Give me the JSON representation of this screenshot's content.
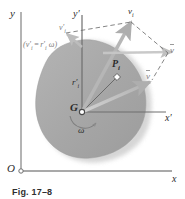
{
  "figure": {
    "caption": "Fig. 17–8",
    "type": "mechanics-diagram"
  },
  "axes": {
    "fixed": {
      "origin_label": "O",
      "x_label": "x",
      "y_label": "y"
    },
    "translating": {
      "x_label": "x′",
      "y_label": "y′"
    }
  },
  "points": {
    "mass_center": "G",
    "particle": "P",
    "particle_subscript": "i"
  },
  "vectors": {
    "absolute_velocity": "v",
    "absolute_velocity_sub": "i",
    "mean_velocity": "v",
    "relative_velocity": "v",
    "relative_velocity_sub": "i",
    "position_vector": "r",
    "position_vector_sub": "i",
    "angular_velocity": "ω"
  },
  "annotations": {
    "relative_speed_relation": "(v′ = r′  ω)",
    "relative_speed_relation_parts": {
      "open": "(",
      "v": "v",
      "v_sub": "i",
      "eq": "=",
      "r": "r",
      "r_sub": "i",
      "omega": "ω",
      "close": ")"
    }
  },
  "colors": {
    "body_fill": "#a9a9a9",
    "body_shadow": "#c9c9c9",
    "axis": "#8c8c8c",
    "vector_light": "#c2c2c2",
    "vector_dark": "#9a9a9a",
    "dashed": "#6f6f6f",
    "text": "#2b2b2b"
  }
}
